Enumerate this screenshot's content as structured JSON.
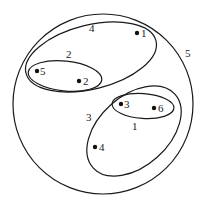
{
  "diagram": {
    "type": "nested-cluster-venn",
    "colors": {
      "stroke": "#1a1a1a",
      "point": "#111111",
      "background": "#ffffff"
    },
    "clusters": [
      {
        "label": "5",
        "members": [
          "1",
          "2",
          "3",
          "4",
          "5",
          "6"
        ]
      },
      {
        "label": "4",
        "members": [
          "1",
          "2",
          "5"
        ]
      },
      {
        "label": "2",
        "members": [
          "2",
          "5"
        ]
      },
      {
        "label": "3",
        "members": [
          "3",
          "4",
          "6"
        ]
      },
      {
        "label": "1",
        "members": [
          "3",
          "6"
        ]
      }
    ],
    "points": [
      {
        "label": "1"
      },
      {
        "label": "2"
      },
      {
        "label": "3"
      },
      {
        "label": "4"
      },
      {
        "label": "5"
      },
      {
        "label": "6"
      }
    ]
  }
}
